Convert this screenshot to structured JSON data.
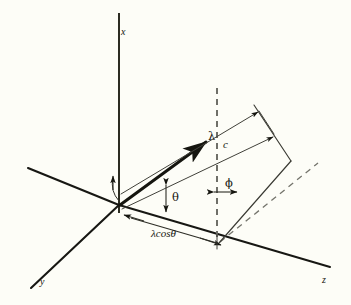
{
  "figure": {
    "kind": "3d-vector-geometry-diagram",
    "background_color": "#fdfdf7",
    "ink_color": "#16160f",
    "dash_color": "#74746c",
    "axes": [
      {
        "id": "x",
        "label": "x",
        "orientation": "vertical-up"
      },
      {
        "id": "y",
        "label": "y",
        "orientation": "lower-left"
      },
      {
        "id": "z",
        "label": "z",
        "orientation": "lower-right"
      }
    ],
    "labels": {
      "x_axis": "x",
      "y_axis": "y",
      "z_axis": "z",
      "vector_lambda": "λ",
      "segment_c": "c",
      "angle_theta": "θ",
      "angle_phi": "ϕ",
      "projection": "λcosθ"
    },
    "annotations": [
      {
        "name": "lambda-vector",
        "text": "λ",
        "role": "vector magnitude label"
      },
      {
        "name": "c-segment",
        "text": "c",
        "role": "band width label"
      },
      {
        "name": "theta-angle",
        "text": "θ",
        "role": "angle between vector and z-axis"
      },
      {
        "name": "phi-angle",
        "text": "ϕ",
        "role": "angle at projection point"
      },
      {
        "name": "lambda-cos-theta",
        "text": "λcosθ",
        "role": "projection length on z-axis"
      }
    ]
  }
}
